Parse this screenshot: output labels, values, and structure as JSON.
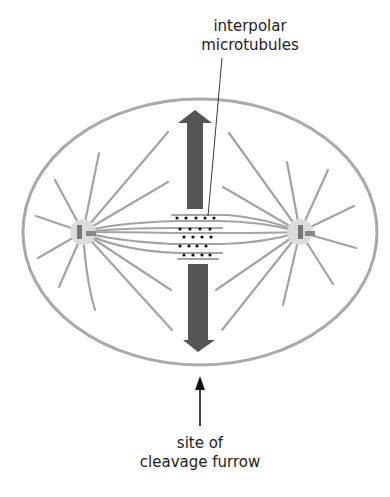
{
  "diagram": {
    "labels": {
      "interpolar_line1": "interpolar",
      "interpolar_line2": "microtubules",
      "furrow_line1": "site of",
      "furrow_line2": "cleavage furrow"
    },
    "colors": {
      "cell_outline": "#a9a9a9",
      "microtubule": "#a3a3a3",
      "centrosome": "#dcdcdc",
      "centriole": "#777777",
      "force_arrow": "#555555",
      "pointer_arrow": "#111111",
      "motor_dots": "#111111",
      "text": "#222222"
    },
    "elements": [
      "cell-membrane",
      "left-spindle-pole",
      "right-spindle-pole",
      "astral-microtubules",
      "interpolar-microtubules-overlap",
      "upward-force-arrow",
      "downward-force-arrow",
      "cleavage-furrow-pointer"
    ]
  }
}
